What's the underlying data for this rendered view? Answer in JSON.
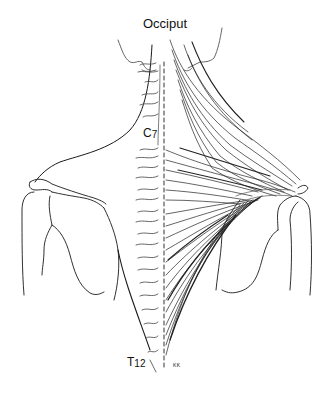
{
  "figure": {
    "labels": {
      "occiput": "Occiput",
      "c7_letter": "C",
      "c7_number": "7",
      "t12_letter": "T",
      "t12_number": "12",
      "signature": "KK"
    },
    "colors": {
      "line": "#1a1a1a",
      "muscle_stroke": "#222222",
      "light_line": "#666666",
      "background": "#ffffff"
    }
  }
}
